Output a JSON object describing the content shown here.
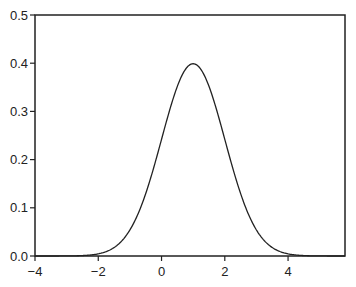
{
  "chart_data": {
    "type": "line",
    "title": "",
    "xlabel": "",
    "ylabel": "",
    "xlim": [
      -4,
      5.8
    ],
    "ylim": [
      0,
      0.5
    ],
    "grid": false,
    "xticks": [
      "−4",
      "−2",
      "0",
      "2",
      "4"
    ],
    "xtick_values": [
      -4,
      -2,
      0,
      2,
      4
    ],
    "yticks": [
      "0.0",
      "0.1",
      "0.2",
      "0.3",
      "0.4",
      "0.5"
    ],
    "ytick_values": [
      0,
      0.1,
      0.2,
      0.3,
      0.4,
      0.5
    ],
    "series": [
      {
        "name": "Normal density (mean 1, sd 1)",
        "mean": 1,
        "sd": 1,
        "color": "#222222",
        "x": [
          -4,
          -3,
          -2,
          -1,
          -0.5,
          0,
          0.5,
          1,
          1.5,
          2,
          2.5,
          3,
          4,
          5,
          5.8
        ],
        "y": [
          1.5e-06,
          0.00013,
          0.0044,
          0.054,
          0.1295,
          0.242,
          0.352,
          0.399,
          0.352,
          0.242,
          0.1295,
          0.054,
          0.0044,
          0.00013,
          5e-06
        ]
      }
    ]
  }
}
